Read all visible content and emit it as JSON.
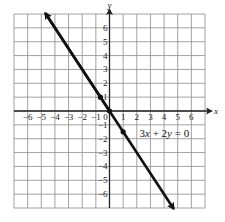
{
  "chart_data": {
    "type": "line",
    "title": "",
    "xlabel": "x",
    "ylabel": "y",
    "xlim": [
      -7,
      7
    ],
    "ylim": [
      -7,
      7
    ],
    "grid": true,
    "x_ticks": [
      -6,
      -5,
      -4,
      -3,
      -2,
      -1,
      0,
      1,
      2,
      3,
      4,
      5,
      6
    ],
    "y_ticks": [
      -6,
      -5,
      -4,
      -3,
      -2,
      -1,
      1,
      2,
      3,
      4,
      5,
      6
    ],
    "series": [
      {
        "name": "3x + 2y = 0",
        "equation": "3x + 2y = 0",
        "slope": -1.5,
        "intercept": 0,
        "x": [
          -4.7,
          4.7
        ],
        "y": [
          7.05,
          -7.05
        ],
        "arrows": "both",
        "color": "#111111"
      }
    ],
    "points": [
      {
        "x": -0.67,
        "y": 1
      },
      {
        "x": 0,
        "y": 0
      },
      {
        "x": 1,
        "y": -1.5
      }
    ],
    "annotations": [
      {
        "text": "3x + 2y = 0",
        "x": 2.2,
        "y": -1.6
      }
    ]
  },
  "labels": {
    "x_axis": "x",
    "y_axis": "y",
    "equation": "3x + 2y = 0"
  }
}
